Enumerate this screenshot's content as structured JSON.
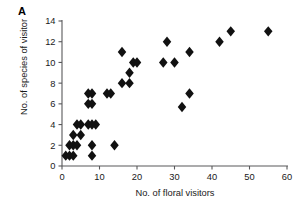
{
  "panel": {
    "label": "A"
  },
  "chart_data": {
    "type": "scatter",
    "title": "",
    "subtitle": "",
    "xlabel": "No. of floral visitors",
    "ylabel": "No. of species of visitor",
    "xlim": [
      0,
      60
    ],
    "ylim": [
      0,
      14
    ],
    "xticks": [
      0,
      10,
      20,
      30,
      40,
      50,
      60
    ],
    "yticks": [
      0,
      2,
      4,
      6,
      8,
      10,
      12,
      14
    ],
    "xtick_labels": [
      "0",
      "10",
      "20",
      "30",
      "40",
      "50",
      "60"
    ],
    "ytick_labels": [
      "0",
      "2",
      "4",
      "6",
      "8",
      "10",
      "12",
      "14"
    ],
    "grid": false,
    "legend": null,
    "marker": {
      "shape": "diamond",
      "color": "#111111",
      "size": 5.2
    },
    "series": [
      {
        "name": "sites",
        "points": [
          [
            1,
            1
          ],
          [
            2,
            1
          ],
          [
            3,
            1
          ],
          [
            8,
            1
          ],
          [
            2,
            2
          ],
          [
            3,
            2
          ],
          [
            4,
            2
          ],
          [
            8,
            2
          ],
          [
            14,
            2
          ],
          [
            3,
            3
          ],
          [
            5,
            3
          ],
          [
            4,
            4
          ],
          [
            5,
            4
          ],
          [
            7,
            4
          ],
          [
            8,
            4
          ],
          [
            9,
            4
          ],
          [
            7,
            6
          ],
          [
            8,
            6
          ],
          [
            7,
            7
          ],
          [
            8,
            7
          ],
          [
            12,
            7
          ],
          [
            13,
            7
          ],
          [
            16,
            8
          ],
          [
            18,
            8
          ],
          [
            18,
            9
          ],
          [
            19,
            10
          ],
          [
            20,
            10
          ],
          [
            27,
            10
          ],
          [
            30,
            10
          ],
          [
            16,
            11
          ],
          [
            34,
            11
          ],
          [
            28,
            12
          ],
          [
            42,
            12
          ],
          [
            45,
            13
          ],
          [
            55,
            13
          ],
          [
            32,
            5.7
          ],
          [
            34,
            7
          ]
        ]
      }
    ]
  }
}
